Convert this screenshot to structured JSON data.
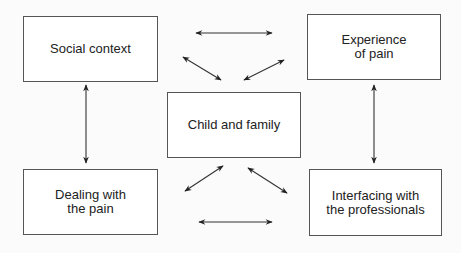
{
  "diagram": {
    "title": "",
    "nodes": {
      "social_context": {
        "label": "Social context"
      },
      "experience_of_pain": {
        "label": "Experience\nof pain"
      },
      "child_and_family": {
        "label": "Child and family"
      },
      "dealing_with_pain": {
        "label": "Dealing with\nthe pain"
      },
      "interfacing_professionals": {
        "label": "Interfacing with\nthe professionals"
      }
    },
    "edges": [
      {
        "from": "Social context",
        "to": "Experience of pain",
        "type": "bidirectional"
      },
      {
        "from": "Social context",
        "to": "Dealing with the pain",
        "type": "bidirectional"
      },
      {
        "from": "Experience of pain",
        "to": "Interfacing with the professionals",
        "type": "bidirectional"
      },
      {
        "from": "Dealing with the pain",
        "to": "Interfacing with the professionals",
        "type": "bidirectional"
      },
      {
        "from": "Child and family",
        "to": "Social context",
        "type": "bidirectional"
      },
      {
        "from": "Child and family",
        "to": "Experience of pain",
        "type": "bidirectional"
      },
      {
        "from": "Child and family",
        "to": "Dealing with the pain",
        "type": "bidirectional"
      },
      {
        "from": "Child and family",
        "to": "Interfacing with the professionals",
        "type": "bidirectional"
      }
    ],
    "colors": {
      "line": "#222222",
      "border": "#555555",
      "background": "#fbfbfb"
    }
  }
}
